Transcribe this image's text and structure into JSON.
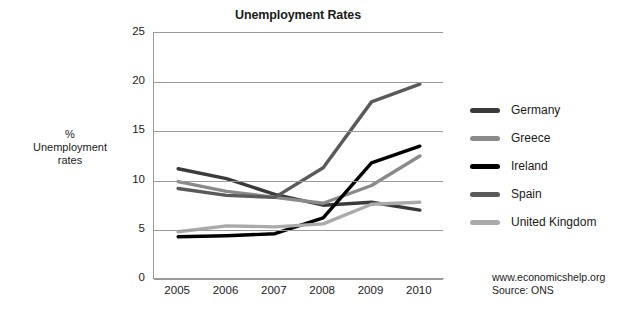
{
  "chart_data": {
    "type": "line",
    "title": "Unemployment Rates",
    "xlabel": "",
    "ylabel": "% Unemployment rates",
    "ylabel_lines": [
      "%",
      "Unemployment",
      "rates"
    ],
    "categories": [
      "2005",
      "2006",
      "2007",
      "2008",
      "2009",
      "2010"
    ],
    "x": [
      2005,
      2006,
      2007,
      2008,
      2009,
      2010
    ],
    "ylim": [
      0,
      25
    ],
    "yticks": [
      "0",
      "5",
      "10",
      "15",
      "20",
      "25"
    ],
    "ytick_values": [
      0,
      5,
      10,
      15,
      20,
      25
    ],
    "grid": true,
    "legend_position": "right",
    "series": [
      {
        "name": "Germany",
        "color": "#3a3a3a",
        "values": [
          11.2,
          10.2,
          8.6,
          7.5,
          7.8,
          7.0
        ]
      },
      {
        "name": "Greece",
        "color": "#8a8a8a",
        "values": [
          9.9,
          8.9,
          8.3,
          7.7,
          9.5,
          12.5
        ]
      },
      {
        "name": "Ireland",
        "color": "#000000",
        "values": [
          4.3,
          4.4,
          4.6,
          6.2,
          11.8,
          13.5
        ]
      },
      {
        "name": "Spain",
        "color": "#5a5a5a",
        "values": [
          9.2,
          8.5,
          8.3,
          11.3,
          18.0,
          19.8
        ]
      },
      {
        "name": "United Kingdom",
        "color": "#aaaaaa",
        "values": [
          4.8,
          5.4,
          5.3,
          5.6,
          7.6,
          7.8
        ]
      }
    ]
  },
  "footer": {
    "website": "www.economicshelp.org",
    "source": "Source: ONS"
  }
}
